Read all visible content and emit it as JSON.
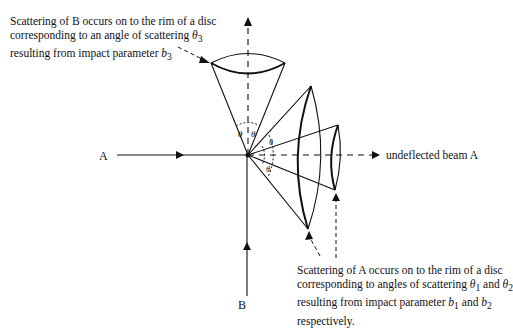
{
  "header": {
    "cut_off_title": ""
  },
  "labels": {
    "beam_a": "A",
    "beam_b": "B",
    "undeflected": "undeflected beam A"
  },
  "captions": {
    "b": {
      "line1": "Scattering of B occurs on to the rim of a disc",
      "line2_pre": "corresponding to an angle of scattering ",
      "line2_sym": "θ",
      "line2_sub": "3",
      "line3_pre": "resulting from impact parameter ",
      "line3_sym": "b",
      "line3_sub": "3"
    },
    "a": {
      "line1": "Scattering of A occurs on to the rim of a disc",
      "line2_pre": "corresponding to angles of scattering ",
      "line2_sym1": "θ",
      "line2_sub1": "1",
      "line2_mid": " and ",
      "line2_sym2": "θ",
      "line2_sub2": "2",
      "line3_pre": "resulting from impact parameter ",
      "line3_sym1": "b",
      "line3_sub1": "1",
      "line3_mid": " and ",
      "line3_sym2": "b",
      "line3_sub2": "2",
      "line4": "respectively."
    }
  },
  "angle_marks": {
    "theta3_left": "θ",
    "theta3_right": "θ",
    "theta_a": "θ"
  },
  "colors": {
    "ink": "#111111",
    "background": "#ffffff"
  }
}
